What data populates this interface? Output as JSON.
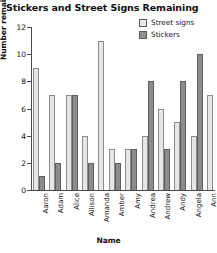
{
  "chart_data": {
    "type": "bar",
    "title": "Stickers and Street Signs Remaining",
    "xlabel": "Name",
    "ylabel": "Number remaining",
    "ylim": [
      0,
      12
    ],
    "yticks": [
      0,
      2,
      4,
      6,
      8,
      10,
      12
    ],
    "grid": false,
    "legend_position": "top-right",
    "categories": [
      "Aaron",
      "Adam",
      "Alice",
      "Allison",
      "Amanda",
      "Amber",
      "Amy",
      "Andrea",
      "Andrew",
      "Andy",
      "Angela",
      "Ann"
    ],
    "series": [
      {
        "name": "Street signs",
        "color": "#e6e6e3",
        "values": [
          9,
          7,
          7,
          4,
          11,
          3,
          3,
          4,
          6,
          5,
          4,
          7
        ]
      },
      {
        "name": "Stickers",
        "color": "#8c8c8c",
        "values": [
          1,
          2,
          7,
          2,
          0,
          2,
          3,
          8,
          3,
          8,
          10,
          0
        ]
      }
    ]
  }
}
